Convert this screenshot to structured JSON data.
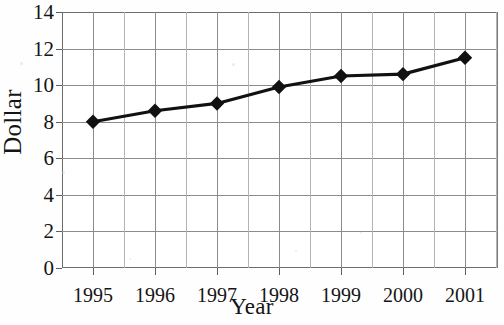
{
  "chart_data": {
    "type": "line",
    "title": "",
    "xlabel": "Year",
    "ylabel": "Dollar",
    "categories": [
      "1995",
      "1996",
      "1997",
      "1998",
      "1999",
      "2000",
      "2001"
    ],
    "x": [
      1995,
      1996,
      1997,
      1998,
      1999,
      2000,
      2001
    ],
    "values": [
      8.0,
      8.6,
      9.0,
      9.9,
      10.5,
      10.6,
      11.5
    ],
    "series": [
      {
        "name": "Dollar",
        "values": [
          8.0,
          8.6,
          9.0,
          9.9,
          10.5,
          10.6,
          11.5
        ]
      }
    ],
    "ylim": [
      0,
      14
    ],
    "yticks": [
      0,
      2,
      4,
      6,
      8,
      10,
      12,
      14
    ],
    "ytick_labels": [
      "0",
      "2",
      "4",
      "6",
      "8",
      "10",
      "12",
      "14"
    ],
    "xlim": [
      1994.5,
      2001.5
    ],
    "grid": true,
    "legend": false,
    "legend_position": "none",
    "marker": "diamond",
    "line_color": "#111111",
    "marker_color": "#111111",
    "grid_color": "#8c8c8c",
    "background_color": "#ffffff"
  }
}
